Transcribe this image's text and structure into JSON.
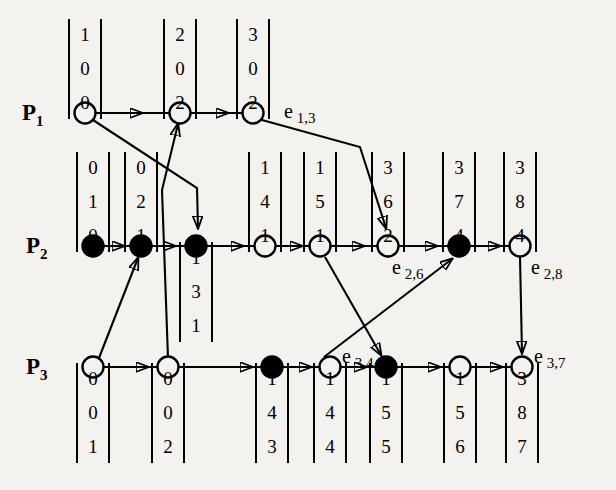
{
  "diagram": {
    "background_color": "#f4f2ee",
    "ink_color": "#000000",
    "processes": [
      {
        "id": "P1",
        "label": "P",
        "subscript": "1"
      },
      {
        "id": "P2",
        "label": "P",
        "subscript": "2"
      },
      {
        "id": "P3",
        "label": "P",
        "subscript": "3"
      }
    ],
    "event_labels": [
      {
        "id": "e13",
        "label": "e",
        "subscript": "1,3"
      },
      {
        "id": "e26",
        "label": "e",
        "subscript": "2,6"
      },
      {
        "id": "e28",
        "label": "e",
        "subscript": "2,8"
      },
      {
        "id": "e34",
        "label": "e",
        "subscript": "3,4"
      },
      {
        "id": "e37",
        "label": "e",
        "subscript": "3,7"
      }
    ],
    "nodes": [
      {
        "id": "n11",
        "process": "P1",
        "index": 1,
        "filled": false,
        "x": 85,
        "y": 113,
        "vector": [
          "1",
          "0",
          "0"
        ],
        "vector_position": "above"
      },
      {
        "id": "n12",
        "process": "P1",
        "index": 2,
        "filled": false,
        "x": 180,
        "y": 113,
        "vector": [
          "2",
          "0",
          "2"
        ],
        "vector_position": "above"
      },
      {
        "id": "n13",
        "process": "P1",
        "index": 3,
        "filled": false,
        "x": 253,
        "y": 113,
        "vector": [
          "3",
          "0",
          "2"
        ],
        "vector_position": "above"
      },
      {
        "id": "n21",
        "process": "P2",
        "index": 1,
        "filled": true,
        "x": 93,
        "y": 246,
        "vector": [
          "0",
          "1",
          "0"
        ],
        "vector_position": "above"
      },
      {
        "id": "n22",
        "process": "P2",
        "index": 2,
        "filled": true,
        "x": 141,
        "y": 246,
        "vector": [
          "0",
          "2",
          "1"
        ],
        "vector_position": "above"
      },
      {
        "id": "n23",
        "process": "P2",
        "index": 3,
        "filled": true,
        "x": 196,
        "y": 246,
        "vector": [
          "1",
          "3",
          "1"
        ],
        "vector_position": "below"
      },
      {
        "id": "n24",
        "process": "P2",
        "index": 4,
        "filled": false,
        "x": 265,
        "y": 246,
        "vector": [
          "1",
          "4",
          "1"
        ],
        "vector_position": "above"
      },
      {
        "id": "n25",
        "process": "P2",
        "index": 5,
        "filled": false,
        "x": 320,
        "y": 246,
        "vector": [
          "1",
          "5",
          "1"
        ],
        "vector_position": "above"
      },
      {
        "id": "n26",
        "process": "P2",
        "index": 6,
        "filled": false,
        "x": 388,
        "y": 246,
        "vector": [
          "3",
          "6",
          "2"
        ],
        "vector_position": "above"
      },
      {
        "id": "n27",
        "process": "P2",
        "index": 7,
        "filled": true,
        "x": 459,
        "y": 246,
        "vector": [
          "3",
          "7",
          "4"
        ],
        "vector_position": "above"
      },
      {
        "id": "n28",
        "process": "P2",
        "index": 8,
        "filled": false,
        "x": 520,
        "y": 246,
        "vector": [
          "3",
          "8",
          "4"
        ],
        "vector_position": "above"
      },
      {
        "id": "n31",
        "process": "P3",
        "index": 1,
        "filled": false,
        "x": 93,
        "y": 367,
        "vector": [
          "0",
          "0",
          "1"
        ],
        "vector_position": "below"
      },
      {
        "id": "n32",
        "process": "P3",
        "index": 2,
        "filled": false,
        "x": 168,
        "y": 367,
        "vector": [
          "0",
          "0",
          "2"
        ],
        "vector_position": "below"
      },
      {
        "id": "n33",
        "process": "P3",
        "index": 3,
        "filled": true,
        "x": 272,
        "y": 367,
        "vector": [
          "1",
          "4",
          "3"
        ],
        "vector_position": "below"
      },
      {
        "id": "n34",
        "process": "P3",
        "index": 4,
        "filled": false,
        "x": 330,
        "y": 367,
        "vector": [
          "1",
          "4",
          "4"
        ],
        "vector_position": "below"
      },
      {
        "id": "n35",
        "process": "P3",
        "index": 5,
        "filled": true,
        "x": 386,
        "y": 367,
        "vector": [
          "1",
          "5",
          "5"
        ],
        "vector_position": "below"
      },
      {
        "id": "n36",
        "process": "P3",
        "index": 6,
        "filled": false,
        "x": 460,
        "y": 367,
        "vector": [
          "1",
          "5",
          "6"
        ],
        "vector_position": "below"
      },
      {
        "id": "n37",
        "process": "P3",
        "index": 7,
        "filled": false,
        "x": 522,
        "y": 367,
        "vector": [
          "3",
          "8",
          "7"
        ],
        "vector_position": "below"
      }
    ],
    "message_edges": [
      {
        "from": "n11",
        "to": "n23",
        "kind": "diagonal-bend"
      },
      {
        "from": "n32",
        "to": "n12",
        "kind": "diagonal-bend"
      },
      {
        "from": "n31",
        "to": "n22",
        "kind": "diagonal"
      },
      {
        "from": "n13",
        "to": "n26",
        "kind": "diagonal-bend"
      },
      {
        "from": "n25",
        "to": "n35",
        "kind": "diagonal"
      },
      {
        "from": "n34",
        "to": "n27",
        "kind": "diagonal"
      },
      {
        "from": "n28",
        "to": "n37",
        "kind": "diagonal"
      }
    ]
  }
}
